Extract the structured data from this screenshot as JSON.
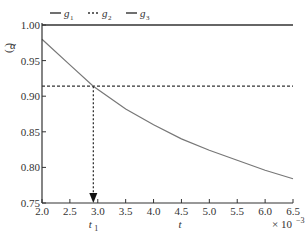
{
  "chart_data": {
    "type": "line",
    "title": "",
    "xlabel": "t",
    "ylabel": "(α)",
    "x_multiplier": "× 10⁻³",
    "xlim": [
      2.0,
      6.5
    ],
    "ylim": [
      0.75,
      1.0
    ],
    "x_ticks": [
      "2.0",
      "2.5",
      "3.0",
      "3.5",
      "4.0",
      "4.5",
      "5.0",
      "5.5",
      "6.0",
      "6.5"
    ],
    "y_ticks": [
      "0.75",
      "0.80",
      "0.85",
      "0.90",
      "0.95",
      "1.00"
    ],
    "grid": false,
    "legend_position": "top",
    "annotation": {
      "label": "t₁",
      "x": 2.92,
      "y": 0.914,
      "style": "dashed vertical arrow to x-axis"
    },
    "series": [
      {
        "name": "g1",
        "style": "solid",
        "color": "#333333",
        "x": [
          2.0,
          6.5
        ],
        "y": [
          1.0,
          1.0
        ]
      },
      {
        "name": "g2",
        "style": "dashed",
        "color": "#333333",
        "x": [
          2.0,
          6.5
        ],
        "y": [
          0.914,
          0.914
        ]
      },
      {
        "name": "g3",
        "style": "solid",
        "color": "#777777",
        "x": [
          2.0,
          2.5,
          2.92,
          3.5,
          4.0,
          4.5,
          5.0,
          5.5,
          6.0,
          6.5
        ],
        "y": [
          0.98,
          0.944,
          0.914,
          0.882,
          0.86,
          0.84,
          0.824,
          0.81,
          0.796,
          0.784
        ]
      }
    ]
  },
  "legend": [
    {
      "label": "g",
      "sub": "1",
      "style": "solid"
    },
    {
      "label": "g",
      "sub": "2",
      "style": "dashed"
    },
    {
      "label": "g",
      "sub": "3",
      "style": "solid"
    }
  ],
  "labels": {
    "t1_label": "t",
    "t1_sub": "1",
    "x_axis": "t",
    "multiplier_prefix": "× 10",
    "multiplier_exp": "−3",
    "y_axis": "α"
  }
}
